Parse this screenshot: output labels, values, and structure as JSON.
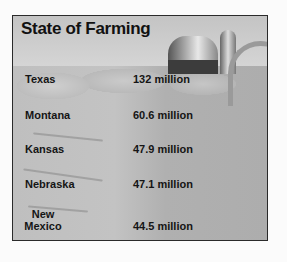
{
  "infographic": {
    "title": "State of Farming",
    "rows": [
      {
        "state": "Texas",
        "value": "132 million"
      },
      {
        "state": "Montana",
        "value": "60.6 million"
      },
      {
        "state": "Kansas",
        "value": "47.9 million"
      },
      {
        "state": "Nebraska",
        "value": "47.1 million"
      },
      {
        "state_line1": "New",
        "state_line2": "Mexico",
        "value": "44.5 million"
      }
    ]
  }
}
